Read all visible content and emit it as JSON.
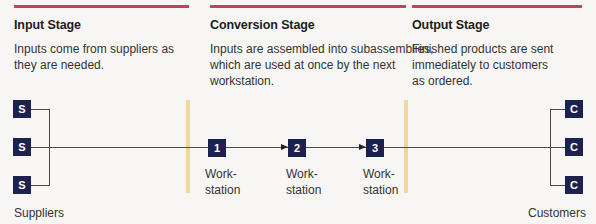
{
  "colors": {
    "header_bar": "#c3415a",
    "node_fill": "#1c2150",
    "divider": "#f2d79a",
    "line": "#4a4a4a"
  },
  "stages": [
    {
      "title": "Input Stage",
      "description_lines": [
        "Inputs come from suppliers as",
        "they are needed."
      ]
    },
    {
      "title": "Conversion Stage",
      "description_lines": [
        "Inputs are assembled into subassemblies,",
        "which are used at once by the next",
        "workstation."
      ]
    },
    {
      "title": "Output Stage",
      "description_lines": [
        "Finished products are sent",
        "immediately to customers",
        "as ordered."
      ]
    }
  ],
  "suppliers": {
    "nodes": [
      "S",
      "S",
      "S"
    ],
    "label": "Suppliers"
  },
  "workstations": [
    {
      "number": "1",
      "label_line1": "Work-",
      "label_line2": "station"
    },
    {
      "number": "2",
      "label_line1": "Work-",
      "label_line2": "station"
    },
    {
      "number": "3",
      "label_line1": "Work-",
      "label_line2": "station"
    }
  ],
  "customers": {
    "nodes": [
      "C",
      "C",
      "C"
    ],
    "label": "Customers"
  }
}
